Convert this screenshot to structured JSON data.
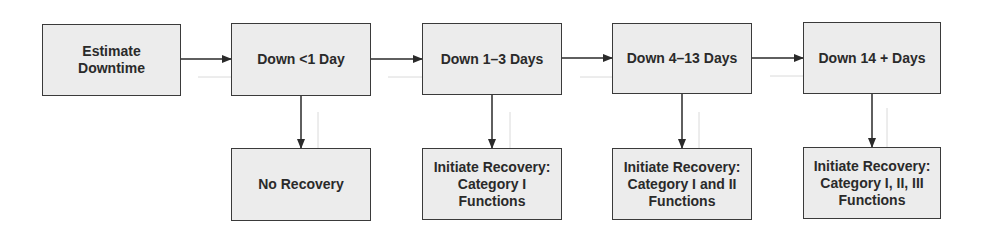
{
  "diagram": {
    "top_row": [
      {
        "id": "estimate",
        "label": "Estimate\nDowntime"
      },
      {
        "id": "lt1",
        "label": "Down <1 Day"
      },
      {
        "id": "d1_3",
        "label": "Down 1–3 Days"
      },
      {
        "id": "d4_13",
        "label": "Down 4–13 Days"
      },
      {
        "id": "d14",
        "label": "Down 14 + Days"
      }
    ],
    "bottom_row": [
      {
        "id": "none",
        "label": "No Recovery"
      },
      {
        "id": "cat1",
        "label": "Initiate Recovery:\nCategory  I\nFunctions"
      },
      {
        "id": "cat12",
        "label": "Initiate Recovery:\nCategory I and II\nFunctions"
      },
      {
        "id": "cat123",
        "label": "Initiate Recovery:\nCategory I, II, III\nFunctions"
      }
    ],
    "colors": {
      "box_fill": "#ececec",
      "border": "#3a3a3a",
      "arrow": "#2a2a2a",
      "ghost_arrow": "#d0d0d0"
    }
  }
}
